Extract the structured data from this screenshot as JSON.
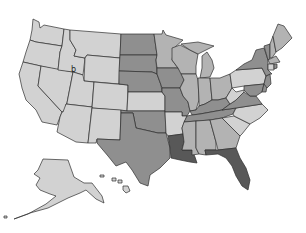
{
  "map": {
    "type": "choropleth",
    "region": "United States",
    "legend_visible": false,
    "shade_levels": {
      "lvl1": "#d2d2d2",
      "lvl2": "#b3b3b3",
      "lvl3": "#8f8f8f",
      "lvl4": "#585858"
    },
    "states": {
      "WA": "lvl1",
      "OR": "lvl1",
      "CA": "lvl1",
      "NV": "lvl1",
      "ID": "lvl1",
      "MT": "lvl1",
      "WY": "lvl1",
      "UT": "lvl1",
      "CO": "lvl1",
      "AZ": "lvl1",
      "NM": "lvl1",
      "AK": "lvl1",
      "HI": "lvl1",
      "AR": "lvl1",
      "WV": "lvl1",
      "PA": "lvl1",
      "NC": "lvl1",
      "SC": "lvl1",
      "KS": "lvl1",
      "CT": "lvl1",
      "MN": "lvl2",
      "WI": "lvl2",
      "MI": "lvl2",
      "IL": "lvl2",
      "IN": "lvl2",
      "OH": "lvl2",
      "MS": "lvl2",
      "AL": "lvl2",
      "GA": "lvl2",
      "ME": "lvl2",
      "NH": "lvl2",
      "MA": "lvl2",
      "ND": "lvl3",
      "SD": "lvl3",
      "NE": "lvl3",
      "IA": "lvl3",
      "MO": "lvl3",
      "OK": "lvl3",
      "TX": "lvl3",
      "KY": "lvl3",
      "TN": "lvl3",
      "VA": "lvl3",
      "NY": "lvl3",
      "VT": "lvl3",
      "NJ": "lvl3",
      "DE": "lvl3",
      "MD": "lvl3",
      "RI": "lvl3",
      "LA": "lvl4",
      "FL": "lvl4"
    },
    "annotations": [
      {
        "text": "b",
        "x": 73,
        "y": 72
      }
    ]
  }
}
